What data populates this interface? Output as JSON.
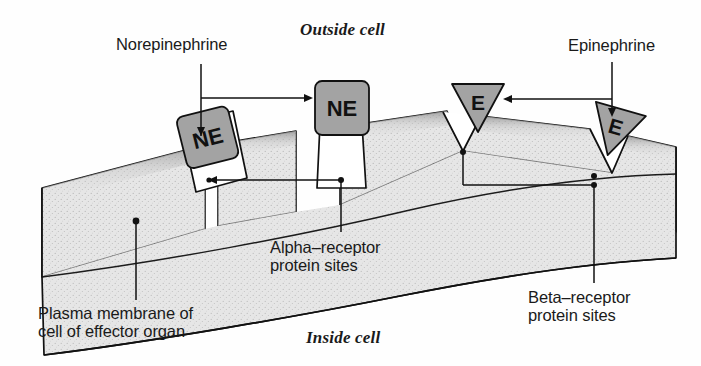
{
  "figure": {
    "title_outside": "Outside cell",
    "title_inside": "Inside cell"
  },
  "labels": {
    "norepinephrine": "Norepinephrine",
    "epinephrine": "Epinephrine",
    "alpha_receptor_line1": "Alpha–receptor",
    "alpha_receptor_line2": "protein sites",
    "beta_receptor_line1": "Beta–receptor",
    "beta_receptor_line2": "protein sites",
    "plasma_membrane_line1": "Plasma membrane of",
    "plasma_membrane_line2": "cell of effector organ"
  },
  "molecules": {
    "ne_abbrev": "NE",
    "e_abbrev": "E",
    "ne_count": 2,
    "e_count": 2
  },
  "colors": {
    "molecule_fill": "#a3a3a3",
    "membrane_fill": "#e6e6e6",
    "receptor_pocket_fill": "#ffffff",
    "stroke": "#111111",
    "page_background": "#ffffff",
    "text": "#1a1a1a"
  },
  "legend_map": {
    "NE": "Norepinephrine",
    "E": "Epinephrine"
  }
}
